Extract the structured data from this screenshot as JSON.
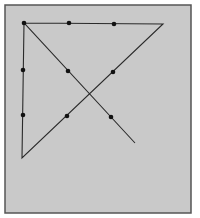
{
  "diagram": {
    "type": "nine-dots-puzzle-solution",
    "frame": {
      "x": 5,
      "y": 5,
      "width": 186,
      "height": 208,
      "fill": "#c9c9c9",
      "stroke": "#555555"
    },
    "dot_color": "#111111",
    "line_color": "#2a2a2a",
    "dots": [
      [
        24,
        23
      ],
      [
        69,
        23
      ],
      [
        114,
        24
      ],
      [
        23,
        70
      ],
      [
        68,
        71
      ],
      [
        113,
        72
      ],
      [
        23,
        115
      ],
      [
        67,
        116
      ],
      [
        111,
        117
      ]
    ],
    "path": [
      [
        24,
        23
      ],
      [
        163,
        24
      ],
      [
        22,
        158
      ],
      [
        24,
        23
      ],
      [
        135,
        143
      ]
    ]
  }
}
